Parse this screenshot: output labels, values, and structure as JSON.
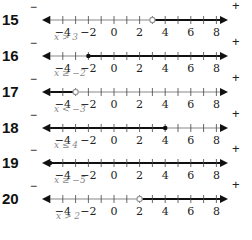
{
  "axis": {
    "min": -5,
    "max": 8,
    "tick_labels": [
      "−4",
      "−2",
      "0",
      "2",
      "4",
      "6",
      "8"
    ],
    "tick_label_values": [
      -4,
      -2,
      0,
      2,
      4,
      6,
      8
    ]
  },
  "rows": [
    {
      "number": "15",
      "minus": "−",
      "plus": "+",
      "point": 3,
      "closed": false,
      "direction": "right",
      "caption": "x > 3"
    },
    {
      "number": "16",
      "minus": "−",
      "plus": "+",
      "point": -2,
      "closed": true,
      "direction": "right",
      "caption": "x ≥ −2"
    },
    {
      "number": "17",
      "minus": "−",
      "plus": "+",
      "point": -3,
      "closed": false,
      "direction": "left",
      "caption": "x < −3"
    },
    {
      "number": "18",
      "minus": "−",
      "plus": "+",
      "point": 4,
      "closed": true,
      "direction": "left",
      "caption": "x ≤ 4"
    },
    {
      "number": "19",
      "minus": "−",
      "plus": "+",
      "point": -5,
      "closed": true,
      "direction": "right",
      "caption": "x ≥ −5"
    },
    {
      "number": "20",
      "minus": "−",
      "plus": "+",
      "point": 2,
      "closed": false,
      "direction": "right",
      "caption": "x > 2"
    }
  ],
  "colors": {
    "line_dark": "#111111",
    "line_light": "#888888",
    "open_circle": "#999999"
  }
}
